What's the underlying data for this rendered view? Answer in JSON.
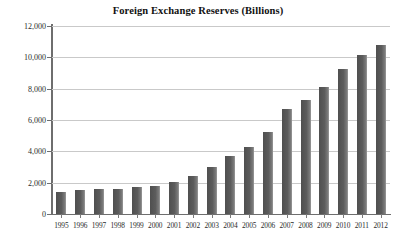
{
  "chart_data": {
    "type": "bar",
    "title": "Foreign Exchange Reserves (Billions)",
    "xlabel": "",
    "ylabel": "",
    "ylim": [
      0,
      12000
    ],
    "yticks": [
      0,
      2000,
      4000,
      6000,
      8000,
      10000,
      12000
    ],
    "ytick_labels": [
      "0",
      "2,000",
      "4,000",
      "6,000",
      "8,000",
      "10,000",
      "12,000"
    ],
    "grid": true,
    "legend": null,
    "categories": [
      "1995",
      "1996",
      "1997",
      "1998",
      "1999",
      "2000",
      "2001",
      "2002",
      "2003",
      "2004",
      "2005",
      "2006",
      "2007",
      "2008",
      "2009",
      "2010",
      "2011",
      "2012"
    ],
    "values": [
      1400,
      1560,
      1600,
      1620,
      1730,
      1800,
      2050,
      2450,
      3000,
      3700,
      4250,
      5250,
      6700,
      7250,
      8100,
      9250,
      10150,
      10800
    ],
    "bar_color": "#575757",
    "gridline_color": "#c9c9c9",
    "axis_color": "#6e6e6e"
  }
}
